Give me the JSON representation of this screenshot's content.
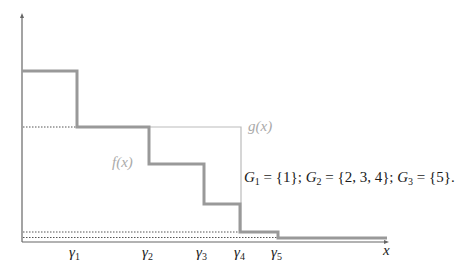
{
  "figure": {
    "axis_x_label": "x",
    "f_label": "f(x)",
    "g_label": "g(x)",
    "gamma_labels": [
      {
        "sym": "γ",
        "sub": "1"
      },
      {
        "sym": "γ",
        "sub": "2"
      },
      {
        "sym": "γ",
        "sub": "3"
      },
      {
        "sym": "γ",
        "sub": "4"
      },
      {
        "sym": "γ",
        "sub": "5"
      }
    ],
    "groups": {
      "g1": {
        "name": "G",
        "sub": "1",
        "value": " = {1}; "
      },
      "g2": {
        "name": "G",
        "sub": "2",
        "value": " = {2, 3, 4}; "
      },
      "g3": {
        "name": "G",
        "sub": "3",
        "value": " = {5}."
      }
    },
    "colors": {
      "axis": "#666666",
      "f_line": "#999999",
      "g_line": "#bbbbbb",
      "dotted": "#555555"
    }
  }
}
